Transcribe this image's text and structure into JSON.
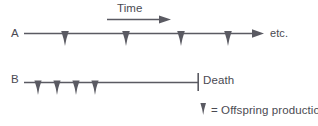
{
  "figure": {
    "type": "life-history-timeline-diagram",
    "background_color": "#ffffff",
    "stroke_color": "#5a5a62",
    "text_color": "#4a4a52",
    "labels": {
      "time_axis": "Time",
      "timeline_a": "A",
      "timeline_a_continues": "etc.",
      "timeline_b": "B",
      "death_marker": "Death",
      "legend": "= Offspring production"
    },
    "time_arrow": {
      "label": "Time",
      "x_start": 107,
      "x_end": 171,
      "y": 19
    },
    "timelines": [
      {
        "name": "A",
        "label": "A",
        "line_y": 33,
        "x_start": 24,
        "x_end": 264,
        "has_terminal_arrow": true,
        "end_note": "etc.",
        "offspring_events_x": [
          65,
          126,
          181,
          228
        ],
        "death_marker": null
      },
      {
        "name": "B",
        "label": "B",
        "line_y": 82,
        "x_start": 24,
        "x_end": 198,
        "has_terminal_arrow": false,
        "end_note": "Death",
        "offspring_events_x": [
          38,
          57,
          76,
          95
        ],
        "death_marker": {
          "x": 198,
          "y_top": 73,
          "y_bottom": 91,
          "label": "Death"
        }
      }
    ],
    "legend": {
      "icon": "down-arrow-icon",
      "icon_x": 203,
      "icon_y": 103,
      "text": "= Offspring production"
    }
  }
}
